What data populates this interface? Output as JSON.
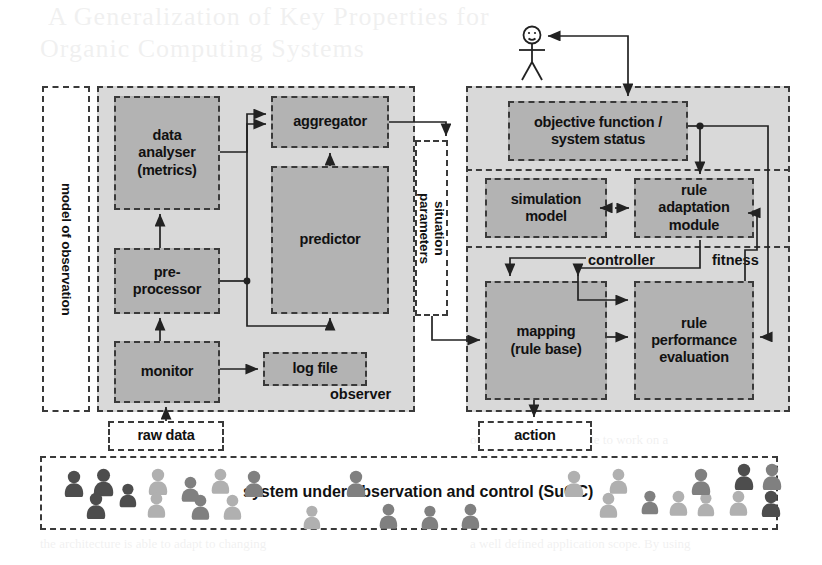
{
  "figure": {
    "title_bleed": [
      "A Generalization of Key Properties for",
      "Organic Computing Systems",
      "objectives and is capable to work on a",
      "such properties the behaviour of the",
      "the architecture is able to adapt to changing",
      "a well defined application scope. By using",
      "objectives  +"
    ]
  },
  "actor": {
    "name": "user-stick-figure"
  },
  "observer": {
    "region_label": "observer",
    "outer_label": "model of observation",
    "blocks": [
      {
        "id": "data-analyser",
        "text": "data\nanalyser\n(metrics)"
      },
      {
        "id": "aggregator",
        "text": "aggregator"
      },
      {
        "id": "predictor",
        "text": "predictor"
      },
      {
        "id": "pre-processor",
        "text": "pre-\nprocessor"
      },
      {
        "id": "monitor",
        "text": "monitor"
      },
      {
        "id": "log-file",
        "text": "log file"
      }
    ]
  },
  "interface": {
    "situation_parameters": "situation\nparameters",
    "raw_data": "raw data",
    "action": "action"
  },
  "controller": {
    "region_label": "controller",
    "fitness_label": "fitness",
    "blocks": [
      {
        "id": "objective-function",
        "text": "objective function /\nsystem status"
      },
      {
        "id": "simulation-model",
        "text": "simulation\nmodel"
      },
      {
        "id": "rule-adaptation-module",
        "text": "rule\nadaptation\nmodule"
      },
      {
        "id": "mapping-rule-base",
        "text": "mapping\n(rule base)"
      },
      {
        "id": "rule-performance-evaluation",
        "text": "rule\nperformance\nevaluation"
      }
    ]
  },
  "suoc": {
    "label": "system under observation and control (SuOC)"
  },
  "colors": {
    "block_fill": "#b3b3b3",
    "region_fill": "#d9d9d9",
    "stroke": "#3a3a3a",
    "text": "#111111",
    "person_dark": "#4d4d4d",
    "person_mid": "#808080",
    "person_light": "#b0b0b0"
  },
  "people": [
    {
      "x": 63,
      "y": 470,
      "s": 1.0,
      "tone": "dark"
    },
    {
      "x": 92,
      "y": 468,
      "s": 1.05,
      "tone": "dark"
    },
    {
      "x": 118,
      "y": 483,
      "s": 0.9,
      "tone": "dark"
    },
    {
      "x": 85,
      "y": 492,
      "s": 1.0,
      "tone": "dark"
    },
    {
      "x": 147,
      "y": 468,
      "s": 1.0,
      "tone": "light"
    },
    {
      "x": 146,
      "y": 492,
      "s": 0.95,
      "tone": "light"
    },
    {
      "x": 180,
      "y": 476,
      "s": 0.95,
      "tone": "mid"
    },
    {
      "x": 210,
      "y": 468,
      "s": 0.95,
      "tone": "light"
    },
    {
      "x": 190,
      "y": 494,
      "s": 0.95,
      "tone": "mid"
    },
    {
      "x": 222,
      "y": 494,
      "s": 0.95,
      "tone": "light"
    },
    {
      "x": 243,
      "y": 470,
      "s": 1.0,
      "tone": "mid"
    },
    {
      "x": 345,
      "y": 470,
      "s": 1.0,
      "tone": "mid"
    },
    {
      "x": 302,
      "y": 505,
      "s": 0.9,
      "tone": "light"
    },
    {
      "x": 378,
      "y": 503,
      "s": 0.95,
      "tone": "mid"
    },
    {
      "x": 420,
      "y": 505,
      "s": 0.9,
      "tone": "mid"
    },
    {
      "x": 460,
      "y": 503,
      "s": 0.95,
      "tone": "mid"
    },
    {
      "x": 563,
      "y": 470,
      "s": 1.0,
      "tone": "light"
    },
    {
      "x": 608,
      "y": 468,
      "s": 0.95,
      "tone": "light"
    },
    {
      "x": 598,
      "y": 492,
      "s": 0.95,
      "tone": "light"
    },
    {
      "x": 640,
      "y": 490,
      "s": 0.9,
      "tone": "mid"
    },
    {
      "x": 668,
      "y": 490,
      "s": 0.95,
      "tone": "light"
    },
    {
      "x": 696,
      "y": 492,
      "s": 0.9,
      "tone": "light"
    },
    {
      "x": 690,
      "y": 468,
      "s": 1.0,
      "tone": "mid"
    },
    {
      "x": 728,
      "y": 490,
      "s": 0.95,
      "tone": "light"
    },
    {
      "x": 733,
      "y": 463,
      "s": 1.0,
      "tone": "dark"
    },
    {
      "x": 761,
      "y": 463,
      "s": 1.0,
      "tone": "mid"
    },
    {
      "x": 760,
      "y": 490,
      "s": 1.0,
      "tone": "dark"
    }
  ]
}
